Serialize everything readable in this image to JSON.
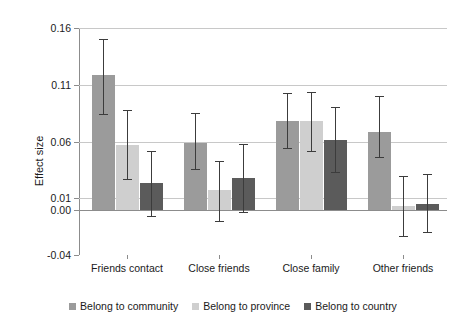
{
  "chart_data": {
    "type": "bar",
    "title": "",
    "xlabel": "",
    "ylabel": "Effect size",
    "ylim": [
      -0.04,
      0.16
    ],
    "yticks": [
      0.16,
      0.11,
      0.06,
      0.01,
      0.0,
      -0.04
    ],
    "ytick_labels": [
      "0.16",
      "0.11",
      "0.06",
      "0.01",
      "0.00",
      "-0.04"
    ],
    "grid": true,
    "grid_axis": "y",
    "legend_position": "bottom",
    "categories": [
      "Friends contact",
      "Close friends",
      "Close family",
      "Other friends"
    ],
    "series": [
      {
        "name": "Belong to community",
        "color": "#9b9b9b",
        "values": [
          0.119,
          0.059,
          0.078,
          0.068
        ],
        "err_low": [
          0.084,
          0.036,
          0.054,
          0.046
        ],
        "err_high": [
          0.15,
          0.085,
          0.103,
          0.1
        ]
      },
      {
        "name": "Belong to province",
        "color": "#cfcfcf",
        "values": [
          0.057,
          0.017,
          0.078,
          0.003
        ],
        "err_low": [
          0.027,
          -0.01,
          0.052,
          -0.023
        ],
        "err_high": [
          0.088,
          0.043,
          0.104,
          0.03
        ]
      },
      {
        "name": "Belong to country",
        "color": "#5b5b5b",
        "values": [
          0.023,
          0.028,
          0.061,
          0.005
        ],
        "err_low": [
          -0.006,
          -0.002,
          0.033,
          -0.02
        ],
        "err_high": [
          0.052,
          0.058,
          0.09,
          0.031
        ]
      }
    ]
  }
}
